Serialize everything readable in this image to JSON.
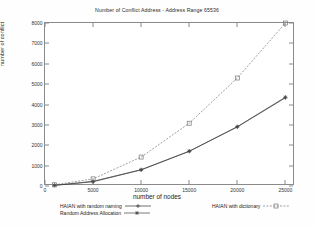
{
  "chart_data": {
    "type": "line",
    "title": "Number of Conflict Address - Address Range 65536",
    "xlabel": "number of nodes",
    "ylabel": "number of conflict",
    "xlim": [
      0,
      26000
    ],
    "ylim": [
      0,
      8000
    ],
    "grid": false,
    "legend_position": "bottom",
    "xticks": [
      "0",
      "5000",
      "10000",
      "15000",
      "20000",
      "25000"
    ],
    "xtick_values": [
      0,
      5000,
      10000,
      15000,
      20000,
      25000
    ],
    "yticks": [
      "0",
      "1000",
      "2000",
      "3000",
      "4000",
      "5000",
      "6000",
      "7000",
      "8000"
    ],
    "ytick_values": [
      0,
      1000,
      2000,
      3000,
      4000,
      5000,
      6000,
      7000,
      8000
    ],
    "x": [
      1000,
      5000,
      10000,
      15000,
      20000,
      25000
    ],
    "series": [
      {
        "name": "HAIAN with random naming",
        "marker": "plus",
        "linestyle": "solid",
        "color": "#333333",
        "values": [
          30,
          210,
          790,
          1700,
          2900,
          4330
        ]
      },
      {
        "name": "Random Address Allocation",
        "marker": "star",
        "linestyle": "solid",
        "color": "#444444",
        "values": [
          35,
          230,
          800,
          1710,
          2910,
          4360
        ]
      },
      {
        "name": "HAIAN with dictionary",
        "marker": "square",
        "linestyle": "dashed",
        "color": "#777777",
        "values": [
          60,
          350,
          1420,
          3080,
          5300,
          8000
        ]
      }
    ]
  },
  "legend": {
    "items": [
      {
        "label": "HAIAN with random naming",
        "key": "solid-plus"
      },
      {
        "label": "Random Address Allocation",
        "key": "solid-star"
      },
      {
        "label": "HAIAN with dictionary",
        "key": "dashed-square"
      }
    ]
  }
}
